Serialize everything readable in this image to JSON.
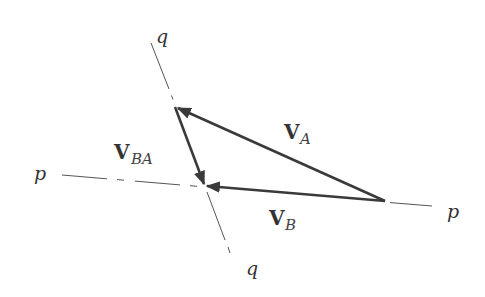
{
  "diagram": {
    "type": "vector-triangle",
    "colors": {
      "vector": "#3a3a3a",
      "axis": "#555555",
      "background": "#ffffff"
    },
    "axes": {
      "p": {
        "label_left": "p",
        "label_right": "p"
      },
      "q": {
        "label_top": "q",
        "label_bottom": "q"
      }
    },
    "vectors": [
      {
        "id": "VA",
        "main": "V",
        "sub": "A"
      },
      {
        "id": "VBA",
        "main": "V",
        "sub": "BA"
      },
      {
        "id": "VB",
        "main": "V",
        "sub": "B"
      }
    ]
  }
}
